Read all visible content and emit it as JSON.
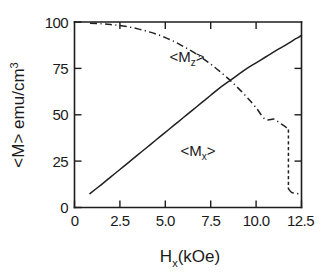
{
  "chart_data": {
    "type": "line",
    "title": "",
    "xlabel": "H_x  (kOe)",
    "xlabel_main": "H",
    "xlabel_sub": "x",
    "xlabel_unit": "(kOe)",
    "ylabel": "<M>  emu/cm^3",
    "ylabel_main": "<M>  emu/cm",
    "ylabel_sup": "3",
    "xlim": [
      0,
      12.5
    ],
    "ylim": [
      0,
      100
    ],
    "grid": false,
    "legend_position": "inline-annotations",
    "xticks": [
      0,
      2.5,
      5.0,
      7.5,
      10.0,
      12.5
    ],
    "xtick_labels": [
      "0",
      "2.5",
      "5.0",
      "7.5",
      "10.0",
      "12.5"
    ],
    "yticks": [
      0,
      25,
      50,
      75,
      100
    ],
    "ytick_labels": [
      "0",
      "25",
      "50",
      "75",
      "100"
    ],
    "series": [
      {
        "name": "<M_x>",
        "label_main": "<M",
        "label_sub": "x",
        "label_end": ">",
        "style": "solid",
        "annotation_x": 6.6,
        "annotation_y": 30,
        "x": [
          0.85,
          1.5,
          2.0,
          2.5,
          3.0,
          3.5,
          4.0,
          4.5,
          5.0,
          5.5,
          6.0,
          6.5,
          7.0,
          7.5,
          8.0,
          8.5,
          9.0,
          9.5,
          10.0,
          10.5,
          11.0,
          11.4,
          11.8,
          12.1,
          12.35,
          12.5
        ],
        "y": [
          7.5,
          12.5,
          16.5,
          20.5,
          24.5,
          28.5,
          32.5,
          36.5,
          40.5,
          44.5,
          48.5,
          52.5,
          56.5,
          60.5,
          64.5,
          68.0,
          71.5,
          75.0,
          78.0,
          81.0,
          84.0,
          86.3,
          88.6,
          90.5,
          91.8,
          92.8
        ]
      },
      {
        "name": "<M_z>",
        "label_main": "<M",
        "label_sub": "z",
        "label_end": ">",
        "style": "dash-dot",
        "annotation_x": 4.25,
        "annotation_y": 86,
        "x": [
          0.85,
          1.5,
          2.0,
          2.5,
          3.0,
          3.5,
          4.0,
          4.5,
          5.0,
          5.5,
          6.0,
          6.5,
          7.0,
          7.5,
          8.0,
          8.5,
          9.0,
          9.5,
          10.0,
          10.5,
          11.0,
          11.3,
          11.55,
          11.7,
          11.78
        ],
        "y": [
          99.3,
          99.0,
          98.6,
          98.1,
          97.3,
          96.3,
          95.0,
          93.5,
          91.6,
          89.4,
          86.8,
          84.0,
          80.8,
          77.3,
          73.4,
          69.2,
          64.5,
          59.4,
          53.8,
          47.6,
          47.6,
          45.5,
          44.0,
          42.8,
          42.0
        ]
      },
      {
        "name": "<M_z> drop",
        "style": "dashed-vertical",
        "x": [
          11.78,
          11.78
        ],
        "y": [
          42.0,
          10.0
        ]
      },
      {
        "name": "<M_z> tail",
        "style": "dash-dot",
        "x": [
          11.78,
          11.95,
          12.2,
          12.5
        ],
        "y": [
          10.0,
          8.2,
          7.6,
          7.3
        ]
      }
    ]
  }
}
